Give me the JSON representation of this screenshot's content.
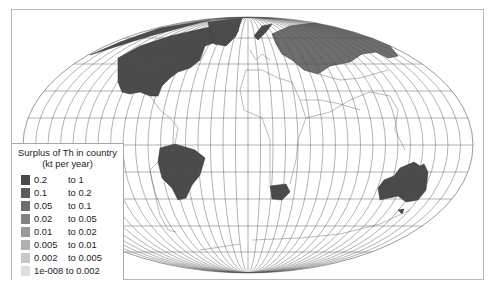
{
  "map": {
    "projection": "Mollweide-like world map with graticule",
    "highlighted_regions": [
      {
        "name": "Canada / United States (North America)",
        "class": "0.2 to 1"
      },
      {
        "name": "Greenland (partial)",
        "class": "0.2 to 1"
      },
      {
        "name": "Russia",
        "class": "0.05 to 0.1"
      },
      {
        "name": "Norway",
        "class": "0.2 to 1"
      },
      {
        "name": "Brazil",
        "class": "0.2 to 1"
      },
      {
        "name": "South Africa",
        "class": "0.2 to 1"
      },
      {
        "name": "Australia",
        "class": "0.2 to 1"
      }
    ]
  },
  "legend": {
    "title_line1": "Surplus of Th in country",
    "title_line2": "(kt per year)",
    "items": [
      {
        "from": "0.2",
        "to": "to 1",
        "color": "#4a4a4a"
      },
      {
        "from": "0.1",
        "to": "to 0.2",
        "color": "#5c5c5c"
      },
      {
        "from": "0.05",
        "to": "to 0.1",
        "color": "#6e6e6e"
      },
      {
        "from": "0.02",
        "to": "to 0.05",
        "color": "#838383"
      },
      {
        "from": "0.01",
        "to": "to 0.02",
        "color": "#9a9a9a"
      },
      {
        "from": "0.005",
        "to": "to 0.01",
        "color": "#b0b0b0"
      },
      {
        "from": "0.002",
        "to": "to 0.005",
        "color": "#c8c8c8"
      },
      {
        "from": "1e-008 to 0.002",
        "to": "",
        "color": "#dedede"
      }
    ]
  }
}
